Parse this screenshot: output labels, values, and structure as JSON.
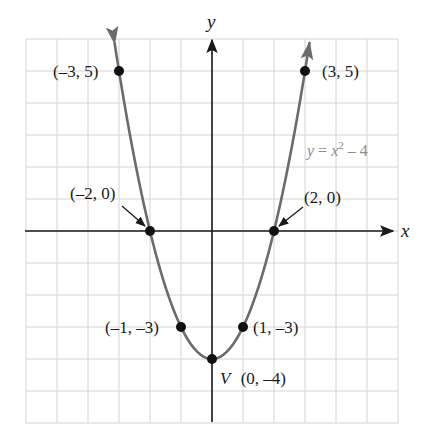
{
  "chart_data": {
    "type": "line",
    "title": "",
    "function": "y = x^2 - 4",
    "xlabel": "x",
    "ylabel": "y",
    "xlim": [
      -6,
      6
    ],
    "ylim": [
      -6,
      6
    ],
    "grid": true,
    "grid_step": 1,
    "series": [
      {
        "name": "y = x^2 - 4",
        "color": "#6b6b6b",
        "x": [
          -3,
          -2,
          -1,
          0,
          1,
          2,
          3
        ],
        "y": [
          5,
          0,
          -3,
          -4,
          -3,
          0,
          5
        ]
      }
    ],
    "points": [
      {
        "x": -3,
        "y": 5,
        "label": "(–3, 5)"
      },
      {
        "x": 3,
        "y": 5,
        "label": "(3, 5)"
      },
      {
        "x": -2,
        "y": 0,
        "label": "(–2, 0)"
      },
      {
        "x": 2,
        "y": 0,
        "label": "(2, 0)"
      },
      {
        "x": -1,
        "y": -3,
        "label": "(–1, –3)"
      },
      {
        "x": 1,
        "y": -3,
        "label": "(1, –3)"
      },
      {
        "x": 0,
        "y": -4,
        "label": "(0, –4)",
        "prefix": "V"
      }
    ],
    "annotations": [
      {
        "text": "y = x² – 4",
        "position": "right of curve, between y=2 and y=3"
      }
    ]
  },
  "labels": {
    "x_axis": "x",
    "y_axis": "y",
    "equation_y": "y",
    "equation_eq": " = ",
    "equation_x": "x",
    "equation_exp": "2",
    "equation_rest": " – 4",
    "vertex_prefix": "V",
    "p_m3_5": "(–3, 5)",
    "p_3_5": "(3, 5)",
    "p_m2_0": "(–2, 0)",
    "p_2_0": "(2, 0)",
    "p_m1_m3": "(–1, –3)",
    "p_1_m3": "(1, –3)",
    "p_0_m4": "(0, –4)"
  },
  "colors": {
    "grid": "#d4d4d4",
    "axis": "#1a1a1a",
    "curve": "#6b6b6b",
    "point": "#111111",
    "equation": "#8c8c8c"
  }
}
